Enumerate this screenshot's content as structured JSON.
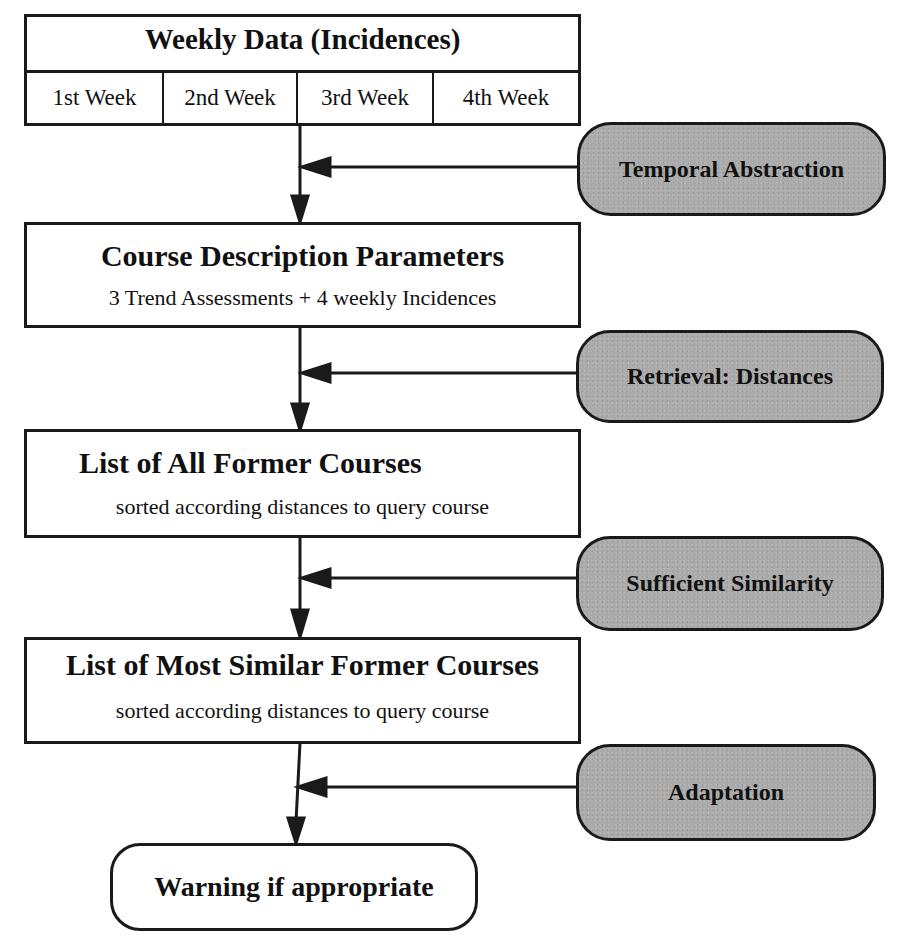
{
  "diagram": {
    "weekly_data": {
      "title": "Weekly Data (Incidences)",
      "weeks": [
        "1st Week",
        "2nd Week",
        "3rd Week",
        "4th Week"
      ]
    },
    "course_description": {
      "title": "Course Description Parameters",
      "subtitle": "3 Trend Assessments + 4 weekly Incidences"
    },
    "all_former_courses": {
      "title": "List of All Former Courses",
      "subtitle": "sorted  according distances to query course"
    },
    "most_similar_courses": {
      "title": "List of Most Similar Former Courses",
      "subtitle": "sorted  according distances to query course"
    },
    "result": {
      "label": "Warning if appropriate"
    },
    "processes": [
      {
        "label": "Temporal Abstraction"
      },
      {
        "label": "Retrieval: Distances"
      },
      {
        "label": "Sufficient Similarity"
      },
      {
        "label": "Adaptation"
      }
    ],
    "colors": {
      "process_fill": "#ababab",
      "stroke": "#1a1a1a",
      "background": "#ffffff"
    }
  }
}
